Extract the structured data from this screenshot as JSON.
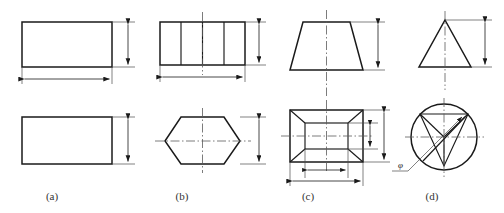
{
  "figure": {
    "stroke_color": "#1a1a1a",
    "centerline_color": "#555555",
    "background": "#ffffff",
    "columns": [
      {
        "key": "a",
        "caption": "(a)",
        "caption_x": 52,
        "front_view": "rectangle",
        "top_view": "rectangle",
        "dimensions": [
          "height",
          "width",
          "height"
        ]
      },
      {
        "key": "b",
        "caption": "(b)",
        "caption_x": 182,
        "front_view": "divided-rectangle",
        "top_view": "hexagon",
        "dimensions": [
          "height",
          "width",
          "height"
        ]
      },
      {
        "key": "c",
        "caption": "(c)",
        "caption_x": 308,
        "front_view": "trapezoid",
        "top_view": "frustum-top-view",
        "dimensions": [
          "height",
          "inner-height",
          "outer-height",
          "inner-width",
          "outer-width"
        ]
      },
      {
        "key": "d",
        "caption": "(d)",
        "caption_x": 432,
        "front_view": "triangle",
        "top_view": "circle-with-inscribed-triangle",
        "dimensions": [
          "height",
          "diameter"
        ]
      }
    ],
    "diameter_symbol": "φ"
  }
}
